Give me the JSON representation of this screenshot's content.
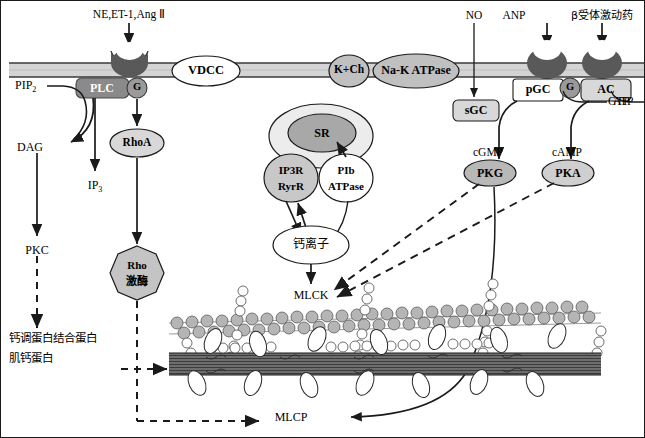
{
  "diagram": {
    "colors": {
      "membrane_fill": "#d4d4d4",
      "membrane_line": "#3a3a3a",
      "receptor_dark": "#595959",
      "protein_gray": "#c0c0c0",
      "protein_light": "#dcdcdc",
      "protein_white": "#ffffff",
      "sr_fill": "#a8a8a8",
      "sr_outer": "#ececec",
      "plc_fill": "#8a8a8a",
      "actin_bead": "#b5b5b5",
      "myosin_bar": "#6e6e6e",
      "stroke": "#1a1a1a"
    }
  },
  "ligands": {
    "gpcr_alpha": "NE,ET-1,Ang Ⅱ",
    "no": "NO",
    "anp": "ANP",
    "beta_agonist": "β受体激动药"
  },
  "membrane_proteins": [
    {
      "id": "vdcc",
      "label": "VDCC",
      "shape": "ellipse",
      "fill": "white"
    },
    {
      "id": "kch",
      "label": "K+Ch",
      "shape": "ellipse",
      "fill": "gray"
    },
    {
      "id": "nak",
      "label": "Na-K  ATPase",
      "shape": "ellipse",
      "fill": "gray"
    }
  ],
  "receptors": [
    {
      "id": "alpha-receptor",
      "label": "",
      "shape": "crescent"
    },
    {
      "id": "anp-receptor",
      "label": "",
      "shape": "crescent"
    },
    {
      "id": "beta-receptor",
      "label": "",
      "shape": "crescent"
    }
  ],
  "effectors": {
    "plc": "PLC",
    "g_protein_alpha": "G",
    "g_protein_beta": "G",
    "sgc": "sGC",
    "pgc": "pGC",
    "ac": "AC",
    "gtp": "GTP",
    "atp": "ATP"
  },
  "messengers": {
    "pip2": "PIP",
    "pip2_sub": "2",
    "dag": "DAG",
    "ip3": "IP",
    "ip3_sub": "3",
    "pkc": "PKC",
    "rhoa": "RhoA",
    "rho_kinase_line1": "Rho",
    "rho_kinase_line2": "激酶",
    "cgmp": "cGMP",
    "camp": "cAMP",
    "pkg": "PKG",
    "pka": "PKA"
  },
  "sr_complex": {
    "sr": "SR",
    "ip3r_line1": "IP3R",
    "ip3r_line2": "RyrR",
    "plb_line1": "PIb",
    "plb_line2": "ATPase",
    "calcium": "钙离子"
  },
  "contractile": {
    "mlck": "MLCK",
    "mlcp": "MLCP",
    "calmodulin_line1": "钙调蛋白结合蛋白",
    "calmodulin_line2": "肌钙蛋白"
  }
}
